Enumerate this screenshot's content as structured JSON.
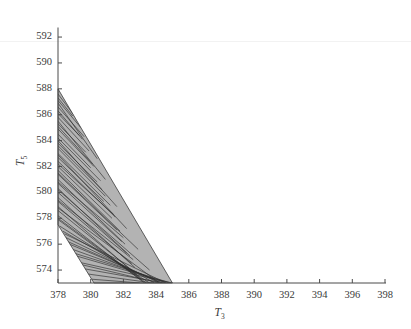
{
  "chart_data": {
    "type": "area",
    "title": "",
    "subtitle": "",
    "xlabel": "T3",
    "ylabel": "T5",
    "xlabel_base": "T",
    "xlabel_sub": "3",
    "ylabel_base": "T",
    "ylabel_sub": "5",
    "xlim": [
      378,
      398
    ],
    "ylim": [
      573,
      592.7
    ],
    "xticks": [
      378,
      380,
      382,
      384,
      386,
      388,
      390,
      392,
      394,
      396,
      398
    ],
    "yticks": [
      574,
      576,
      578,
      580,
      582,
      584,
      586,
      588,
      590,
      592
    ],
    "xtick_labels": [
      "378",
      "380",
      "382",
      "384",
      "386",
      "388",
      "390",
      "392",
      "394",
      "396",
      "398"
    ],
    "ytick_labels": [
      "574",
      "576",
      "578",
      "580",
      "582",
      "584",
      "586",
      "588",
      "590",
      "592"
    ],
    "grid": false,
    "legend": null,
    "tick_direction": "in",
    "spines": [
      "left",
      "bottom"
    ],
    "fill_color": "#b3b3b3",
    "edge_color": "#3c3c3c",
    "line_color": "#333333",
    "background": "#ffffff",
    "region_name": "feasible-region",
    "region_polygon": [
      [
        378.0,
        588.0
      ],
      [
        378.0,
        577.5
      ],
      [
        380.2,
        573.0
      ],
      [
        385.0,
        573.0
      ]
    ],
    "region_description": "Narrow wedge-shaped shaded region crossed by many near-linear trajectory segments.",
    "trajectories": [
      [
        [
          378.0,
          587.6
        ],
        [
          379.2,
          585.6
        ]
      ],
      [
        [
          378.0,
          587.1
        ],
        [
          379.4,
          585.0
        ]
      ],
      [
        [
          378.0,
          586.6
        ],
        [
          379.6,
          584.3
        ]
      ],
      [
        [
          378.0,
          586.1
        ],
        [
          379.3,
          584.4
        ]
      ],
      [
        [
          378.0,
          585.8
        ],
        [
          379.9,
          583.2
        ]
      ],
      [
        [
          378.0,
          585.3
        ],
        [
          379.7,
          583.1
        ]
      ],
      [
        [
          378.0,
          584.9
        ],
        [
          380.2,
          582.0
        ]
      ],
      [
        [
          378.0,
          584.5
        ],
        [
          380.0,
          581.9
        ]
      ],
      [
        [
          378.0,
          584.2
        ],
        [
          380.6,
          580.9
        ]
      ],
      [
        [
          378.0,
          583.8
        ],
        [
          380.4,
          580.8
        ]
      ],
      [
        [
          378.0,
          583.4
        ],
        [
          380.9,
          579.7
        ]
      ],
      [
        [
          378.0,
          583.0
        ],
        [
          381.2,
          579.0
        ]
      ],
      [
        [
          378.0,
          582.7
        ],
        [
          380.8,
          579.3
        ]
      ],
      [
        [
          378.0,
          582.4
        ],
        [
          381.5,
          578.1
        ]
      ],
      [
        [
          378.0,
          582.0
        ],
        [
          381.3,
          578.0
        ]
      ],
      [
        [
          378.0,
          581.7
        ],
        [
          381.8,
          577.0
        ]
      ],
      [
        [
          378.0,
          581.4
        ],
        [
          381.6,
          577.1
        ]
      ],
      [
        [
          378.0,
          581.0
        ],
        [
          382.1,
          576.0
        ]
      ],
      [
        [
          378.0,
          580.7
        ],
        [
          381.9,
          576.2
        ]
      ],
      [
        [
          378.0,
          580.3
        ],
        [
          382.4,
          575.1
        ]
      ],
      [
        [
          378.0,
          580.0
        ],
        [
          382.2,
          575.3
        ]
      ],
      [
        [
          378.0,
          579.6
        ],
        [
          382.7,
          574.2
        ]
      ],
      [
        [
          378.0,
          579.3
        ],
        [
          382.5,
          574.5
        ]
      ],
      [
        [
          378.0,
          578.9
        ],
        [
          383.0,
          573.4
        ]
      ],
      [
        [
          378.0,
          578.6
        ],
        [
          382.8,
          573.7
        ]
      ],
      [
        [
          378.0,
          578.2
        ],
        [
          383.3,
          573.0
        ]
      ],
      [
        [
          378.0,
          577.9
        ],
        [
          383.1,
          573.2
        ]
      ],
      [
        [
          378.1,
          577.4
        ],
        [
          383.6,
          573.0
        ]
      ],
      [
        [
          378.3,
          577.0
        ],
        [
          383.9,
          573.0
        ]
      ],
      [
        [
          378.5,
          576.5
        ],
        [
          384.2,
          573.0
        ]
      ],
      [
        [
          378.7,
          576.0
        ],
        [
          384.4,
          573.0
        ]
      ],
      [
        [
          378.9,
          575.6
        ],
        [
          384.6,
          573.0
        ]
      ],
      [
        [
          379.1,
          575.1
        ],
        [
          384.8,
          573.0
        ]
      ],
      [
        [
          379.3,
          574.6
        ],
        [
          385.0,
          573.0
        ]
      ],
      [
        [
          379.6,
          574.1
        ],
        [
          384.5,
          573.0
        ]
      ],
      [
        [
          379.8,
          573.7
        ],
        [
          383.8,
          573.0
        ]
      ],
      [
        [
          380.0,
          573.3
        ],
        [
          383.0,
          573.0
        ]
      ],
      [
        [
          378.0,
          586.9
        ],
        [
          380.4,
          582.6
        ]
      ],
      [
        [
          378.0,
          585.5
        ],
        [
          380.9,
          581.0
        ]
      ],
      [
        [
          378.0,
          584.0
        ],
        [
          381.6,
          578.9
        ]
      ],
      [
        [
          378.0,
          582.9
        ],
        [
          382.2,
          577.2
        ]
      ],
      [
        [
          378.0,
          581.5
        ],
        [
          382.9,
          575.6
        ]
      ],
      [
        [
          378.0,
          580.2
        ],
        [
          383.6,
          574.0
        ]
      ],
      [
        [
          378.0,
          578.8
        ],
        [
          384.1,
          573.1
        ]
      ],
      [
        [
          378.4,
          576.8
        ],
        [
          384.6,
          573.0
        ]
      ],
      [
        [
          379.0,
          575.3
        ],
        [
          384.9,
          573.0
        ]
      ],
      [
        [
          378.0,
          587.3
        ],
        [
          378.9,
          585.9
        ]
      ],
      [
        [
          378.0,
          586.3
        ],
        [
          379.5,
          584.1
        ]
      ],
      [
        [
          378.0,
          585.1
        ],
        [
          380.1,
          582.2
        ]
      ],
      [
        [
          378.0,
          583.6
        ],
        [
          380.7,
          580.2
        ]
      ],
      [
        [
          378.0,
          582.2
        ],
        [
          381.4,
          578.3
        ]
      ],
      [
        [
          378.0,
          580.8
        ],
        [
          382.0,
          576.5
        ]
      ],
      [
        [
          378.0,
          579.4
        ],
        [
          382.6,
          574.8
        ]
      ],
      [
        [
          378.0,
          578.0
        ],
        [
          383.4,
          573.0
        ]
      ],
      [
        [
          378.6,
          576.2
        ],
        [
          384.3,
          573.0
        ]
      ],
      [
        [
          379.5,
          574.4
        ],
        [
          384.2,
          573.0
        ]
      ]
    ]
  }
}
